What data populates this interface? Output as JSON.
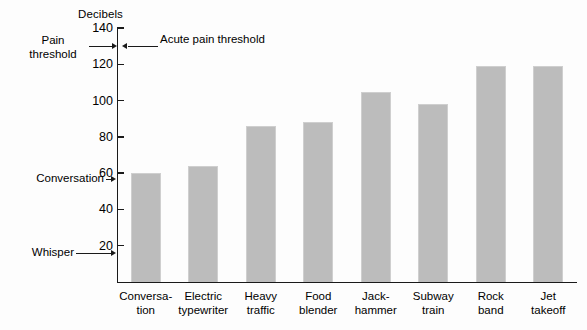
{
  "chart_data": {
    "type": "bar",
    "title": "",
    "ylabel": "Decibels",
    "xlabel": "",
    "ylim": [
      0,
      140
    ],
    "yticks": [
      20,
      40,
      60,
      80,
      100,
      120,
      140
    ],
    "grid": false,
    "legend": "none",
    "categories": [
      "Conversa-\ntion",
      "Electric\ntypewriter",
      "Heavy\ntraffic",
      "Food\nblender",
      "Jack-\nhammer",
      "Subway\ntrain",
      "Rock\nband",
      "Jet\ntakeoff"
    ],
    "values": [
      60,
      64,
      86,
      88,
      105,
      98,
      119,
      119
    ],
    "bar_color": "#bcbcbc",
    "annotations": [
      {
        "text": "Acute pain threshold",
        "value": 132,
        "side": "inside-right"
      },
      {
        "text": "Pain\nthreshold",
        "value": 132,
        "side": "left"
      },
      {
        "text": "Conversation",
        "value": 60,
        "side": "left"
      },
      {
        "text": "Whisper",
        "value": 20,
        "side": "left"
      }
    ]
  },
  "axis": {
    "title": "Decibels",
    "tick_labels": [
      "140",
      "120",
      "100",
      "80",
      "60",
      "40",
      "20"
    ]
  },
  "annotations": {
    "acute": "Acute pain threshold",
    "pain": "Pain\nthreshold",
    "conversation": "Conversation",
    "whisper": "Whisper"
  },
  "categories": {
    "c0": "Conversa-\ntion",
    "c1": "Electric\ntypewriter",
    "c2": "Heavy\ntraffic",
    "c3": "Food\nblender",
    "c4": "Jack-\nhammer",
    "c5": "Subway\ntrain",
    "c6": "Rock\nband",
    "c7": "Jet\ntakeoff"
  }
}
